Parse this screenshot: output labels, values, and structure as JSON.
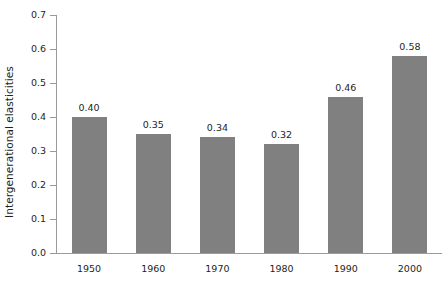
{
  "chart_data": {
    "type": "bar",
    "title": "",
    "xlabel": "",
    "ylabel": "Intergenerational elasticities",
    "categories": [
      "1950",
      "1960",
      "1970",
      "1980",
      "1990",
      "2000"
    ],
    "values": [
      0.4,
      0.35,
      0.34,
      0.32,
      0.46,
      0.58
    ],
    "data_labels": [
      "0.40",
      "0.35",
      "0.34",
      "0.32",
      "0.46",
      "0.58"
    ],
    "ylim": [
      0.0,
      0.7
    ],
    "ytick_labels": [
      "0.0",
      "0.1",
      "0.2",
      "0.3",
      "0.4",
      "0.5",
      "0.6",
      "0.7"
    ],
    "ytick_values": [
      0.0,
      0.1,
      0.2,
      0.3,
      0.4,
      0.5,
      0.6,
      0.7
    ],
    "grid": false,
    "legend": "none",
    "bar_color": "#808080",
    "axis_color": "#9a9a9a",
    "text_color": "#231f20",
    "background": "#ffffff"
  }
}
